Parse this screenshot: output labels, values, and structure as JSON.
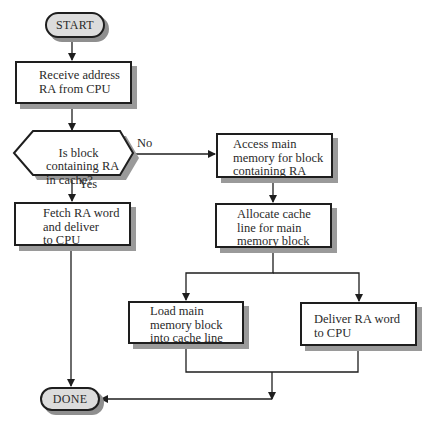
{
  "diagram": {
    "type": "flowchart",
    "nodes": {
      "start": {
        "label": "START",
        "shape": "terminal"
      },
      "receive": {
        "label": "Receive address\nRA from CPU",
        "shape": "process"
      },
      "decision": {
        "label": "Is block\ncontaining RA\nin cache?",
        "shape": "decision"
      },
      "access": {
        "label": "Access main\nmemory for block\ncontaining RA",
        "shape": "process"
      },
      "fetch": {
        "label": "Fetch RA word\nand deliver\nto CPU",
        "shape": "process"
      },
      "allocate": {
        "label": "Allocate cache\nline for main\nmemory block",
        "shape": "process"
      },
      "load": {
        "label": "Load main\nmemory block\ninto cache line",
        "shape": "process"
      },
      "deliver": {
        "label": "Deliver RA word\nto CPU",
        "shape": "process"
      },
      "done": {
        "label": "DONE",
        "shape": "terminal"
      }
    },
    "edge_labels": {
      "no": "No",
      "yes": "Yes"
    },
    "edges": [
      {
        "from": "start",
        "to": "receive"
      },
      {
        "from": "receive",
        "to": "decision"
      },
      {
        "from": "decision",
        "to": "access",
        "label": "No"
      },
      {
        "from": "decision",
        "to": "fetch",
        "label": "Yes"
      },
      {
        "from": "fetch",
        "to": "done"
      },
      {
        "from": "access",
        "to": "allocate"
      },
      {
        "from": "allocate",
        "to": "load"
      },
      {
        "from": "allocate",
        "to": "deliver"
      },
      {
        "from": "load",
        "to": "done"
      },
      {
        "from": "deliver",
        "to": "done"
      }
    ],
    "colors": {
      "stroke": "#1e1e1e",
      "shadow": "#9a9a9a",
      "terminal_fill": "#dcdcdc",
      "box_fill": "#ffffff"
    }
  }
}
